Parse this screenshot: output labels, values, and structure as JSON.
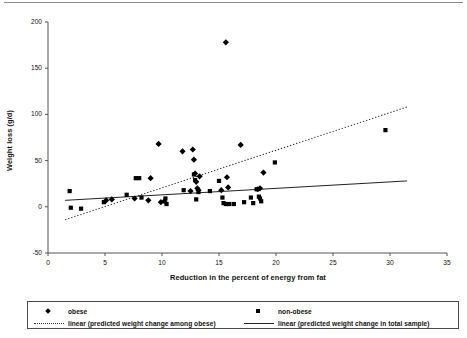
{
  "chart_data": {
    "type": "scatter",
    "title": "",
    "xlabel": "Reduction in the percent of energy from fat",
    "ylabel": "Weight loss (g/d)",
    "xlim": [
      0,
      35
    ],
    "ylim": [
      -50,
      200
    ],
    "xticks": [
      0,
      5,
      10,
      15,
      20,
      25,
      30,
      35
    ],
    "yticks": [
      -50,
      0,
      50,
      100,
      150,
      200
    ],
    "grid": false,
    "legend_position": "bottom",
    "series": [
      {
        "name": "obese",
        "marker": "diamond",
        "color": "#000000",
        "points": [
          [
            5.1,
            7
          ],
          [
            5.6,
            8
          ],
          [
            7.6,
            9
          ],
          [
            8.8,
            7
          ],
          [
            9.0,
            31
          ],
          [
            9.7,
            68
          ],
          [
            9.9,
            5
          ],
          [
            10.2,
            6
          ],
          [
            11.8,
            60
          ],
          [
            12.5,
            17
          ],
          [
            12.7,
            62
          ],
          [
            12.8,
            51
          ],
          [
            12.9,
            36
          ],
          [
            13.0,
            27
          ],
          [
            13.1,
            20
          ],
          [
            13.2,
            18
          ],
          [
            13.3,
            33
          ],
          [
            15.2,
            18
          ],
          [
            15.6,
            178
          ],
          [
            15.7,
            32
          ],
          [
            15.8,
            21
          ],
          [
            16.9,
            67
          ],
          [
            18.4,
            19
          ],
          [
            18.6,
            20
          ],
          [
            18.9,
            37
          ]
        ]
      },
      {
        "name": "non-obese",
        "marker": "square",
        "color": "#000000",
        "points": [
          [
            1.9,
            17
          ],
          [
            2.0,
            -1
          ],
          [
            2.9,
            -2
          ],
          [
            4.9,
            5
          ],
          [
            6.9,
            13
          ],
          [
            7.7,
            31
          ],
          [
            8.0,
            31
          ],
          [
            8.2,
            10
          ],
          [
            10.3,
            9
          ],
          [
            10.4,
            3
          ],
          [
            11.9,
            18
          ],
          [
            12.8,
            35
          ],
          [
            12.9,
            29
          ],
          [
            13.0,
            8
          ],
          [
            13.2,
            16
          ],
          [
            14.2,
            17
          ],
          [
            15.0,
            28
          ],
          [
            15.3,
            10
          ],
          [
            15.4,
            4
          ],
          [
            15.6,
            3
          ],
          [
            15.9,
            3
          ],
          [
            16.3,
            3
          ],
          [
            17.2,
            5
          ],
          [
            17.8,
            10
          ],
          [
            18.0,
            4
          ],
          [
            18.3,
            19
          ],
          [
            18.5,
            11
          ],
          [
            18.6,
            9
          ],
          [
            18.7,
            6
          ],
          [
            19.9,
            48
          ],
          [
            29.6,
            83
          ]
        ]
      }
    ],
    "trendlines": [
      {
        "name": "linear (predicted weight change among obese)",
        "style": "dotted",
        "color": "#333333",
        "x1": 1.5,
        "y1": -14,
        "x2": 31.5,
        "y2": 108
      },
      {
        "name": "linear (predicted weight change in total sample)",
        "style": "solid",
        "color": "#222222",
        "x1": 1.5,
        "y1": 7,
        "x2": 31.5,
        "y2": 28
      }
    ]
  },
  "axes": {
    "y_label": "Weight loss (g/d)",
    "x_label": "Reduction in the percent of energy from fat",
    "y_tick_labels": [
      "200",
      "150",
      "100",
      "50",
      "0",
      "-50"
    ],
    "x_tick_labels": [
      "0",
      "5",
      "10",
      "15",
      "20",
      "25",
      "30",
      "35"
    ]
  },
  "legend": {
    "entries": [
      {
        "label": "obese",
        "marker": "diamond-marker"
      },
      {
        "label": "non-obese",
        "marker": "square-marker"
      },
      {
        "label": "linear (predicted weight change among obese)",
        "marker": "dotted-line"
      },
      {
        "label": "linear (predicted weight change in total sample)",
        "marker": "solid-line"
      }
    ]
  }
}
